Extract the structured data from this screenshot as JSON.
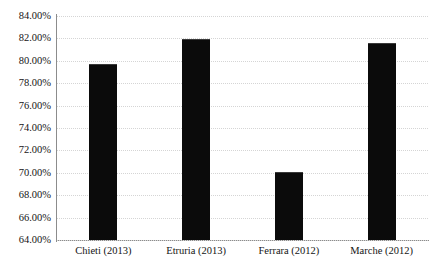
{
  "chart_data": {
    "type": "bar",
    "title": "",
    "subtitle": "",
    "xlabel": "",
    "ylabel": "",
    "categories": [
      "Chieti (2013)",
      "Etruria (2013)",
      "Ferrara (2012)",
      "Marche (2012)"
    ],
    "values": [
      79.65,
      81.85,
      70.0,
      81.5
    ],
    "series": [
      {
        "name": "",
        "values": [
          79.65,
          81.85,
          70.0,
          81.5
        ]
      }
    ],
    "ylim": [
      64.0,
      84.0
    ],
    "ytick_labels": [
      "84.00%",
      "82.00%",
      "80.00%",
      "78.00%",
      "76.00%",
      "74.00%",
      "72.00%",
      "70.00%",
      "68.00%",
      "66.00%",
      "64.00%"
    ],
    "ytick_values": [
      84,
      82,
      80,
      78,
      76,
      74,
      72,
      70,
      68,
      66,
      64
    ],
    "value_format": "percent",
    "grid": "horizontal-dotted",
    "legend": "none",
    "bar_color": "#0b0b0b",
    "grid_color": "#d5d5d5",
    "axis_color": "#8c8c8c",
    "background_color": "#ffffff"
  }
}
